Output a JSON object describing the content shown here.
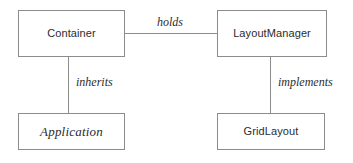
{
  "diagram": {
    "type": "uml-class-diagram",
    "width": 353,
    "height": 163,
    "background_color": "#ffffff",
    "border_color": "#8c8c8c",
    "text_color": "#2b2b2b",
    "nodes": [
      {
        "id": "container",
        "label": "Container",
        "style": "concrete",
        "position": "top-left"
      },
      {
        "id": "layoutmanager",
        "label": "LayoutManager",
        "style": "concrete",
        "position": "top-right"
      },
      {
        "id": "application",
        "label": "Application",
        "style": "abstract-italic",
        "position": "bottom-left"
      },
      {
        "id": "gridlayout",
        "label": "GridLayout",
        "style": "concrete",
        "position": "bottom-right"
      }
    ],
    "edges": [
      {
        "id": "holds",
        "label": "holds",
        "from": "container",
        "to": "layoutmanager",
        "orientation": "horizontal"
      },
      {
        "id": "inherits",
        "label": "inherits",
        "from": "container",
        "to": "application",
        "orientation": "vertical"
      },
      {
        "id": "implements",
        "label": "implements",
        "from": "layoutmanager",
        "to": "gridlayout",
        "orientation": "vertical"
      }
    ]
  }
}
